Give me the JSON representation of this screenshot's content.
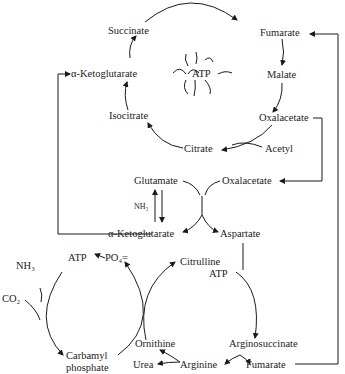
{
  "diagram": {
    "krebs_cycle": {
      "center": "ATP",
      "nodes": [
        "Succinate",
        "Fumarate",
        "Malate",
        "Oxalacetate",
        "Citrate",
        "Isocitrate",
        "α-Ketoglutarate"
      ],
      "input": "Acetyl"
    },
    "transamination": {
      "glutamate": "Glutamate",
      "oxalacetate": "Oxalacetate",
      "nh3": "NH₃",
      "alpha_ketoglutarate": "α-Ketoglutarate",
      "aspartate": "Aspartate"
    },
    "urea_cycle": {
      "nh3": "NH₃",
      "co2": "CO₂",
      "atp_left": "ATP",
      "po4": "PO₄=",
      "carbamyl": "Carbamyl",
      "phosphate": "phosphate",
      "citrulline": "Citrulline",
      "atp_right": "ATP",
      "ornithine": "Ornithine",
      "argininosuccinate": "Arginosuccinate",
      "urea": "Urea",
      "arginine": "Arginine",
      "fumarate": "Fumarate"
    }
  }
}
